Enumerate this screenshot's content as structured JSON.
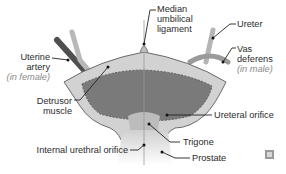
{
  "diagram": {
    "colors": {
      "wall": "#cfcfcf",
      "wall_outline": "#6e6e6e",
      "lumen": "#7d7d7d",
      "tube_dark": "#5a5a5a",
      "tube_light": "#bdbdbd",
      "label_text": "#2b2b2b",
      "note_text": "#8a8a8a"
    },
    "labels": {
      "median_umbilical": [
        "Median",
        "umbilical",
        "ligament"
      ],
      "ureter": "Ureter",
      "vas_deferens": [
        "Vas",
        "deferens"
      ],
      "vas_note": "(in male)",
      "uterine_artery": [
        "Uterine",
        "artery"
      ],
      "uterine_note": "(in female)",
      "detrusor": [
        "Detrusor",
        "muscle"
      ],
      "ureteral_orifice": "Ureteral orifice",
      "trigone": "Trigone",
      "internal_urethral_orifice": "Internal urethral orifice",
      "prostate": "Prostate"
    }
  }
}
